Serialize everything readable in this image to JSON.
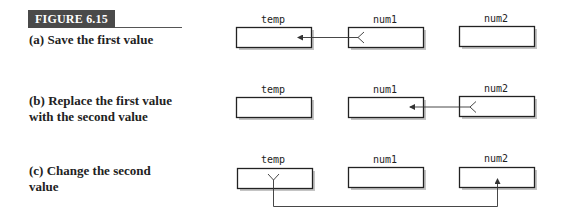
{
  "figure": {
    "label": "FIGURE 6.15"
  },
  "rows": [
    {
      "caption": "(a) Save the first value",
      "caption_lines": [
        "(a) Save the first value"
      ],
      "variables": [
        "temp",
        "num1",
        "num2"
      ],
      "arrow": {
        "from": "num1",
        "to": "temp"
      }
    },
    {
      "caption": "(b) Replace the first value with the second value",
      "caption_lines": [
        "(b) Replace the first value",
        "with the second value"
      ],
      "variables": [
        "temp",
        "num1",
        "num2"
      ],
      "arrow": {
        "from": "num2",
        "to": "num1"
      }
    },
    {
      "caption": "(c) Change the second value",
      "caption_lines": [
        "(c) Change the second",
        "value"
      ],
      "variables": [
        "temp",
        "num1",
        "num2"
      ],
      "arrow": {
        "from": "temp",
        "to": "num2"
      }
    }
  ],
  "colors": {
    "badge_bg": "#4a4a4a",
    "box_stroke": "#222222",
    "box_shadow": "#bdbdbd",
    "arrow": "#333333"
  }
}
